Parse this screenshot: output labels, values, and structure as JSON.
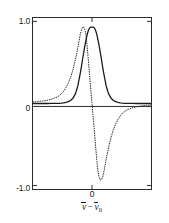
{
  "figure": {
    "background_color": "#ffffff",
    "frame_color": "#2b2b2b"
  },
  "axes": {
    "y_ticks": [
      {
        "value": 1.0,
        "label": "1.0"
      },
      {
        "value": 0.0,
        "label": "0"
      },
      {
        "value": -1.0,
        "label": "-1.0"
      }
    ],
    "x_ticks": [
      {
        "value": 0,
        "label": "0"
      }
    ],
    "x_title_parts": {
      "nu": "v",
      "operator": "−",
      "nu_zero": "v",
      "subscript": "0"
    },
    "x_title_plain": "v̄ − v̄0"
  },
  "chart_data": {
    "type": "line",
    "title": "",
    "subtitle": "",
    "xlabel": "ν̄ − ν̄₀",
    "ylabel": "",
    "xlim": [
      -5,
      5
    ],
    "ylim": [
      -1.12,
      1.12
    ],
    "grid": false,
    "legend": "none",
    "annotations": [],
    "x": [
      -5,
      -4.6,
      -4.2,
      -3.8,
      -3.4,
      -3,
      -2.8,
      -2.6,
      -2.4,
      -2.2,
      -2,
      -1.8,
      -1.6,
      -1.4,
      -1.2,
      -1,
      -0.9,
      -0.8,
      -0.7,
      -0.6,
      -0.5,
      -0.4,
      -0.3,
      -0.2,
      -0.1,
      0,
      0.1,
      0.2,
      0.3,
      0.4,
      0.5,
      0.6,
      0.7,
      0.8,
      0.9,
      1,
      1.2,
      1.4,
      1.6,
      1.8,
      2,
      2.2,
      2.4,
      2.6,
      2.8,
      3,
      3.4,
      3.8,
      4.2,
      4.6,
      5
    ],
    "series": [
      {
        "name": "absorption",
        "style": "solid",
        "color": "#1a1a1a",
        "values": [
          0.0,
          0.0,
          0.0,
          0.0,
          0.001,
          0.002,
          0.003,
          0.005,
          0.008,
          0.014,
          0.024,
          0.042,
          0.073,
          0.13,
          0.23,
          0.39,
          0.48,
          0.58,
          0.67,
          0.76,
          0.84,
          0.91,
          0.96,
          0.99,
          1.0,
          1.0,
          1.0,
          0.99,
          0.96,
          0.91,
          0.84,
          0.76,
          0.67,
          0.58,
          0.48,
          0.39,
          0.23,
          0.13,
          0.073,
          0.042,
          0.024,
          0.014,
          0.008,
          0.005,
          0.003,
          0.002,
          0.001,
          0.0,
          0.0,
          0.0,
          0.0
        ]
      },
      {
        "name": "dispersion",
        "style": "dotted",
        "color": "#1a1a1a",
        "values": [
          0.02,
          0.025,
          0.032,
          0.042,
          0.058,
          0.082,
          0.1,
          0.125,
          0.16,
          0.21,
          0.27,
          0.35,
          0.45,
          0.58,
          0.73,
          0.9,
          0.96,
          1.0,
          1.0,
          0.97,
          0.88,
          0.73,
          0.55,
          0.36,
          0.18,
          0.0,
          -0.18,
          -0.36,
          -0.55,
          -0.73,
          -0.88,
          -0.97,
          -1.0,
          -1.0,
          -0.96,
          -0.9,
          -0.73,
          -0.58,
          -0.45,
          -0.35,
          -0.27,
          -0.21,
          -0.16,
          -0.125,
          -0.1,
          -0.082,
          -0.058,
          -0.042,
          -0.032,
          -0.025,
          -0.02
        ]
      }
    ]
  }
}
